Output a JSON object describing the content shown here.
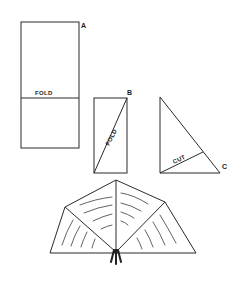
{
  "diagram": {
    "step_a": {
      "label": "A",
      "fold_label": "FOLD"
    },
    "step_b": {
      "label": "B",
      "fold_label": "FOLD"
    },
    "step_c": {
      "label": "C",
      "cut_label": "CUT"
    },
    "result": {
      "description": "folded fan shape with tassel"
    }
  },
  "colors": {
    "line": "#2a2a2a",
    "background": "#ffffff"
  }
}
